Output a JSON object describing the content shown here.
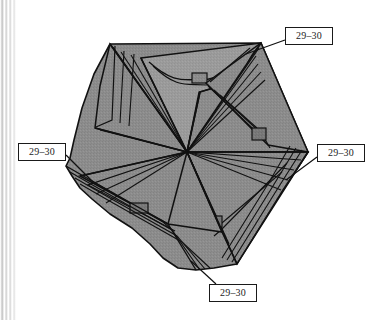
{
  "figure": {
    "type": "technical-line-drawing",
    "background_color": "#ffffff",
    "fill_color": "#8a8a8a",
    "fill_shadow_color": "#737373",
    "fill_highlight_color": "#9a9a9a",
    "line_color": "#111111",
    "label_text_color": "#1c1c1c",
    "label_border_color": "#1a1a1a",
    "label_background_color": "#ffffff"
  },
  "scan_artifact": {
    "name": "page-spine-stripes",
    "position": "left",
    "width_px": 17
  },
  "callouts": [
    {
      "id": "callout-top-right",
      "label": "29–30",
      "x": 285,
      "y": 27,
      "width": 48,
      "height": 18
    },
    {
      "id": "callout-left",
      "label": "29–30",
      "x": 18,
      "y": 143,
      "width": 48,
      "height": 18
    },
    {
      "id": "callout-right",
      "label": "29–30",
      "x": 317,
      "y": 144,
      "width": 48,
      "height": 18
    },
    {
      "id": "callout-bottom",
      "label": "29–30",
      "x": 209,
      "y": 284,
      "width": 48,
      "height": 18
    }
  ],
  "leader_lines": [
    {
      "id": "leader-top-right",
      "from": [
        285,
        40
      ],
      "to": [
        246,
        54
      ]
    },
    {
      "id": "leader-left",
      "from": [
        66,
        156
      ],
      "to": [
        92,
        181
      ]
    },
    {
      "id": "leader-right",
      "from": [
        317,
        158
      ],
      "to": [
        285,
        180
      ]
    },
    {
      "id": "leader-bottom",
      "from": [
        215,
        284
      ],
      "to": [
        190,
        262
      ]
    }
  ],
  "geometry": {
    "center": [
      187,
      152
    ],
    "outer_pentagon": [
      [
        110,
        44
      ],
      [
        261,
        43
      ],
      [
        308,
        152
      ],
      [
        237,
        264
      ],
      [
        90,
        223
      ]
    ],
    "panel_count": 5,
    "description": "Five overlapping quadrilateral panels spiraling around a common center vertex, each with stepped stacked-sheet edges and a small rectangular tab."
  }
}
